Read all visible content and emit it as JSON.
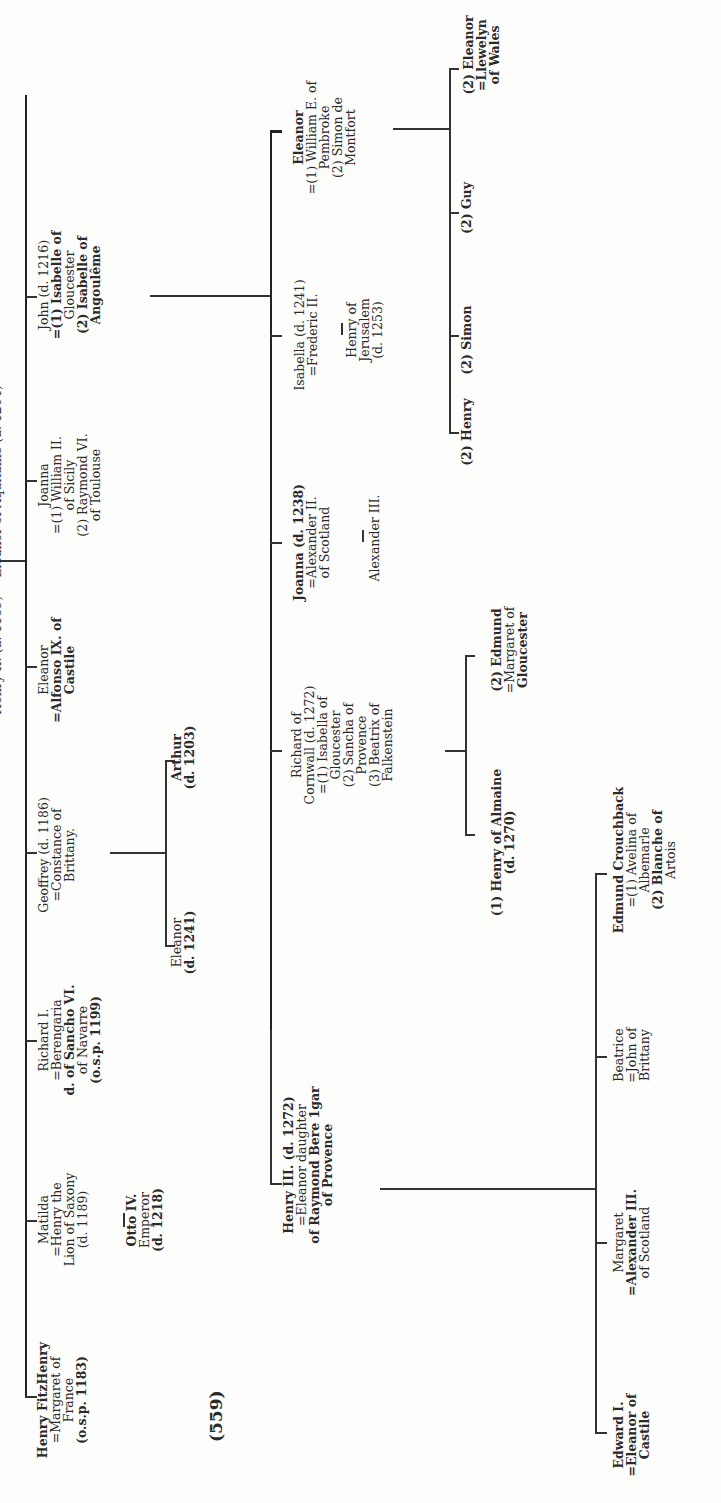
{
  "header": {
    "text": "Henry II. (d. 1189) = Eleanor of Aquitaine (d. 1204)",
    "visibility": "cropped at left edge"
  },
  "page_number": "(559)",
  "generation_1": [
    {
      "id": "henry-fitzhenry",
      "lines": [
        "Henry FitzHenry",
        "=Margaret of",
        "France",
        "(o.s.p. 1183)"
      ],
      "bold": [
        true,
        false,
        false,
        true
      ]
    },
    {
      "id": "matilda",
      "lines": [
        "Matilda",
        "=Henry the",
        "Lion of Saxony",
        "(d. 1189)"
      ]
    },
    {
      "id": "richard-i",
      "lines": [
        "Richard I.",
        "=Berengaria",
        "d. of Sancho VI.",
        "of Navarre",
        "(o.s.p. 1199)"
      ]
    },
    {
      "id": "geoffrey",
      "lines": [
        "Geoffrey (d. 1186)",
        "=Constance of",
        "Brittany."
      ]
    },
    {
      "id": "eleanor-castile",
      "lines": [
        "Eleanor",
        "=Alfonso IX. of",
        "Castile"
      ]
    },
    {
      "id": "joanna",
      "lines": [
        "Joanna",
        "=(1) William II.",
        "of Sicily",
        "(2) Raymond VI.",
        "of Toulouse"
      ]
    },
    {
      "id": "john",
      "lines": [
        "John (d. 1216)",
        "=(1) Isabelle of",
        "Gloucester",
        "(2) Isabelle of",
        "Angoulême"
      ]
    }
  ],
  "matilda_child": {
    "lines": [
      "Otto IV.",
      "Emperor",
      "(d. 1218)"
    ]
  },
  "geoffrey_children": [
    {
      "lines": [
        "Eleanor",
        "(d. 1241)"
      ]
    },
    {
      "lines": [
        "Arthur",
        "(d. 1203)"
      ]
    }
  ],
  "generation_2": [
    {
      "id": "henry-iii",
      "lines": [
        "Henry III. (d. 1272)",
        "=Eleanor daughter",
        "of Raymond Bere 1gar",
        "of Provence"
      ]
    },
    {
      "id": "richard-cornwall",
      "lines": [
        "Richard of",
        "Cornwall (d. 1272)",
        "=(1) Isabella of",
        "Gloucester",
        "(2) Sancha of",
        "Provence",
        "(3) Beatrix of",
        "Falkenstein"
      ]
    },
    {
      "id": "joanna-scotland",
      "lines": [
        "Joanna (d. 1238)",
        "=Alexander II.",
        "of Scotland"
      ]
    },
    {
      "id": "isabella",
      "lines": [
        "Isabella (d. 1241)",
        "=Frederic II."
      ]
    },
    {
      "id": "eleanor-pembroke",
      "lines": [
        "Eleanor",
        "=(1) William E. of",
        "Pembroke",
        "(2) Simon de",
        "Montfort"
      ]
    }
  ],
  "richard_children": [
    {
      "lines": [
        "(1) Henry of Almaine",
        "(d. 1270)"
      ]
    },
    {
      "lines": [
        "(2) Edmund",
        "=Margaret of",
        "Gloucester"
      ]
    }
  ],
  "joanna_child": {
    "lines": [
      "Alexander III."
    ]
  },
  "isabella_child": {
    "lines": [
      "Henry of",
      "Jerusalem",
      "(d. 1253)"
    ]
  },
  "montfort_children": [
    {
      "lines": [
        "(2) Henry"
      ]
    },
    {
      "lines": [
        "(2) Simon"
      ]
    },
    {
      "lines": [
        "(2) Guy"
      ]
    },
    {
      "lines": [
        "(2) Eleanor",
        "=Llewelyn",
        "of Wales"
      ]
    }
  ],
  "generation_3": [
    {
      "id": "edward-i",
      "lines": [
        "Edward I.",
        "=Eleanor of",
        "Castile"
      ]
    },
    {
      "id": "margaret",
      "lines": [
        "Margaret",
        "=Alexander III.",
        "of Scotland"
      ]
    },
    {
      "id": "beatrice",
      "lines": [
        "Beatrice",
        "=John of",
        "Brittany"
      ]
    },
    {
      "id": "edmund-crouchback",
      "lines": [
        "Edmund Crouchback",
        "=(1) Avelina of",
        "Albemarle",
        "(2) Blanche of",
        "Artois"
      ]
    }
  ]
}
